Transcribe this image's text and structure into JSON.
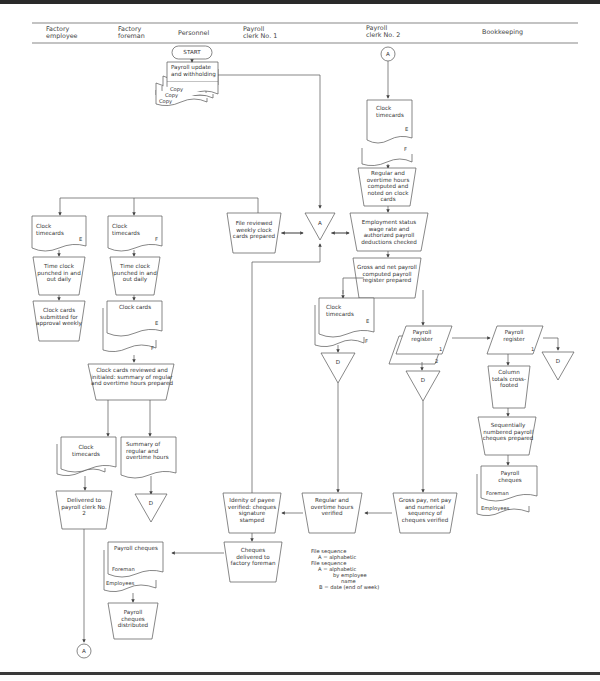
{
  "columns": [
    {
      "label": "Factory\nemployee"
    },
    {
      "label": "Factory\nforeman"
    },
    {
      "label": "Personnel"
    },
    {
      "label": "Payroll\nclerk No. 1"
    },
    {
      "label": "Payroll\nclerk No. 2"
    },
    {
      "label": "Bookkeeping"
    }
  ],
  "terminals": {
    "start": "START",
    "connector_top": "A",
    "connector_bottom": "A",
    "offpage_a": "A"
  },
  "nodes": {
    "payroll_update": "Payroll update and withholding",
    "copy1": "Copy",
    "copy2": "Copy",
    "copy3": "Copy",
    "clock_timecards_ef_top": "Clock timecards",
    "e_label": "E",
    "f_label": "F",
    "regular_overtime_computed": "Regular and overtime hours computed and noted on clock cards",
    "employment_status": "Employment status wage rate and authorized payroll deductions checked",
    "file_reviewed": "File reviewed weekly clock cards prepared",
    "emp_clock_timecards": "Clock timecards",
    "foreman_clock_timecards": "Clock timecards",
    "time_clock_emp": "Time clock punched in and out daily",
    "time_clock_foreman": "Time clock punched in and out daily",
    "clock_cards_submitted": "Clock cards submitted for approval weekly",
    "clock_cards_foreman": "Clock cards",
    "clock_cards_reviewed": "Clock cards reviewed and initialed: summary of regular and overtime hours prepared",
    "clock_timecards_return": "Clock timecards",
    "summary_hours": "Summary of regular and overtime hours",
    "delivered_to_clerk2": "Delivered to payroll clerk No. 2",
    "gross_net_computed": "Gross and net payroll computed payroll register prepared",
    "clock_timecards_clerk2": "Clock timecards",
    "payroll_register_2copy": "Payroll register",
    "payroll_register_book": "Payroll register",
    "reg_sub1": "1",
    "reg_sub2": "2",
    "reg_sub3": "1",
    "file_d": "D",
    "column_totals": "Column totals cross-footed",
    "sequential_cheques": "Sequentially numbered payroll cheques prepared",
    "payroll_cheques_book": "Payroll cheques",
    "foreman_label": "Foreman",
    "employees_label": "Employees",
    "gross_pay_verified": "Gross pay, net pay and numerical sequency of cheques verified",
    "regular_overtime_verified": "Regular and overtime hours verified",
    "identity_verified": "Idenity of payee verified: cheques signature stamped",
    "cheques_delivered": "Cheques delivered to factory foreman",
    "payroll_cheques_foreman": "Payroll cheques",
    "payroll_cheques_distributed": "Payroll cheques distributed"
  },
  "legend": {
    "line1": "File sequence",
    "line2": "A = alphabetic",
    "line3": "File sequence",
    "line4": "A = alphabetic",
    "line5": "by employee",
    "line6": "name",
    "line7": "B = date (end of week)"
  }
}
